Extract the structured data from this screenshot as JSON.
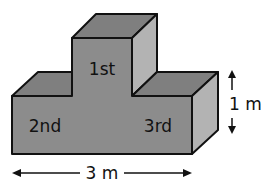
{
  "diagram": {
    "type": "podium",
    "labels": {
      "first": "1st",
      "second": "2nd",
      "third": "3rd"
    },
    "dimensions": {
      "height": "1 m",
      "width": "3 m"
    },
    "colors": {
      "front": "#8c8c8c",
      "top": "#7f7f7f",
      "side": "#b3b3b3",
      "stroke": "#111111"
    }
  }
}
